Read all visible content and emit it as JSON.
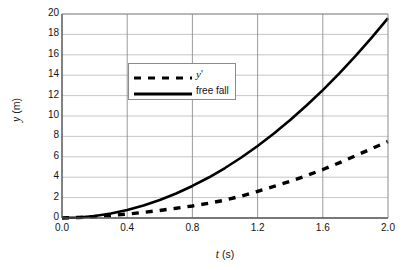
{
  "chart_data": {
    "type": "line",
    "title": "",
    "xlabel": "t (s)",
    "xlabel_symbol": "t",
    "xlabel_unit": "(s)",
    "ylabel": "y (m)",
    "ylabel_symbol": "y",
    "ylabel_unit": "(m)",
    "xlim": [
      0.0,
      2.0
    ],
    "ylim": [
      0,
      20
    ],
    "xticks": [
      "0.0",
      "0.4",
      "0.8",
      "1.2",
      "1.6",
      "2.0"
    ],
    "yticks": [
      "0",
      "2",
      "4",
      "6",
      "8",
      "10",
      "12",
      "14",
      "16",
      "18",
      "20"
    ],
    "grid": "both",
    "legend_position": "upper-left-inside",
    "x": [
      0.0,
      0.1,
      0.2,
      0.3,
      0.4,
      0.5,
      0.6,
      0.7,
      0.8,
      0.9,
      1.0,
      1.1,
      1.2,
      1.3,
      1.4,
      1.5,
      1.6,
      1.7,
      1.8,
      1.9,
      2.0
    ],
    "series": [
      {
        "name": "y'",
        "style": "dashed",
        "color": "#000000",
        "values": [
          0.0,
          0.05,
          0.14,
          0.25,
          0.38,
          0.55,
          0.74,
          0.95,
          1.18,
          1.45,
          1.75,
          2.15,
          2.62,
          3.1,
          3.6,
          4.15,
          4.75,
          5.4,
          6.1,
          6.8,
          7.5
        ]
      },
      {
        "name": "free fall",
        "style": "solid",
        "color": "#000000",
        "values": [
          0.0,
          0.05,
          0.2,
          0.44,
          0.78,
          1.23,
          1.76,
          2.4,
          3.14,
          3.97,
          4.9,
          5.93,
          7.06,
          8.28,
          9.6,
          11.03,
          12.54,
          14.16,
          15.88,
          17.69,
          19.6
        ]
      }
    ]
  },
  "legend": {
    "entries": [
      {
        "label": "y'",
        "label_symbol": "y",
        "label_suffix": "'",
        "style": "dashed"
      },
      {
        "label": "free fall",
        "label_symbol": "free fall",
        "label_suffix": "",
        "style": "solid"
      }
    ]
  }
}
